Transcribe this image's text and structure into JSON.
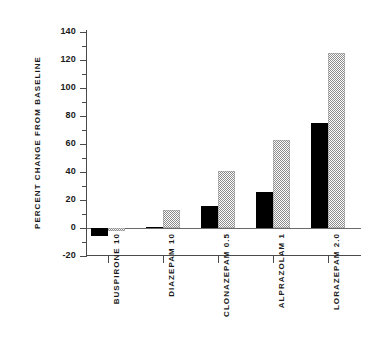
{
  "chart_data": {
    "type": "bar",
    "title": "",
    "xlabel": "",
    "ylabel": "PERCENT CHANGE FROM BASELINE",
    "ylim": [
      -20,
      140
    ],
    "ytick_step": 20,
    "yminor_step": 10,
    "grid": false,
    "legend_position": "none",
    "categories": [
      "BUSPIRONE 10",
      "DIAZEPAM 10",
      "CLONAZEPAM 0.5",
      "ALPRAZOLAM 1",
      "LORAZEPAM 2.0"
    ],
    "ytick_labels": [
      "140",
      "120",
      "100",
      "80",
      "60",
      "40",
      "20",
      "0",
      "-20"
    ],
    "ytick_values": [
      140,
      120,
      100,
      80,
      60,
      40,
      20,
      0,
      -20
    ],
    "yminor_values": [
      130,
      110,
      90,
      70,
      50,
      30,
      10,
      -10
    ],
    "series": [
      {
        "name": "solid",
        "fill": "solid-black",
        "color": "#000000",
        "values": [
          -6,
          1,
          16,
          26,
          75
        ]
      },
      {
        "name": "hatched",
        "fill": "stippled-gray",
        "color": "#8c8c8c",
        "values": [
          -2,
          13,
          41,
          63,
          125
        ]
      }
    ]
  }
}
